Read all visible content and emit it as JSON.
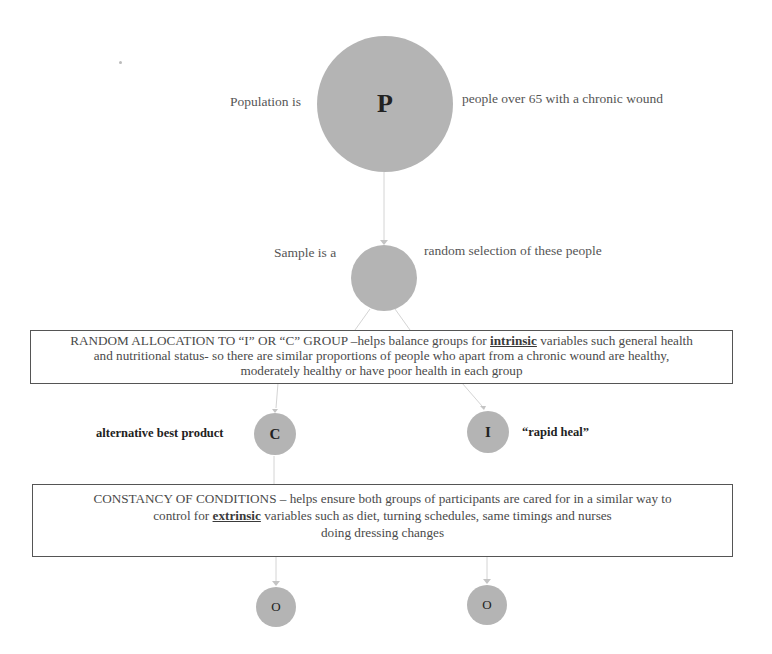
{
  "colors": {
    "node_fill": "#b4b4b4",
    "connector": "#d0d0d0",
    "box_border": "#555555",
    "text": "#555555"
  },
  "nodes": {
    "population": {
      "letter": "P",
      "label_left": "Population is",
      "label_right": "people over 65 with a chronic wound"
    },
    "sample": {
      "letter": "",
      "label_left": "Sample is a",
      "label_right": "random selection of these people"
    },
    "control": {
      "letter": "C",
      "label_left": "alternative best product"
    },
    "intervention": {
      "letter": "I",
      "label_right": "“rapid heal”"
    },
    "outcome_c": {
      "letter": "O"
    },
    "outcome_i": {
      "letter": "O"
    }
  },
  "boxes": {
    "random_allocation": {
      "line1_pre": "RANDOM ALLOCATION TO “I” OR “C” GROUP –helps balance groups for ",
      "keyword": "intrinsic",
      "line1_post": " variables such general health",
      "line2": "and nutritional status- so there are similar proportions of people who apart from a chronic wound are healthy,",
      "line3": "moderately healthy or have poor health in each group"
    },
    "constancy": {
      "line1": "CONSTANCY OF CONDITIONS – helps ensure both groups of participants are cared for in a similar way to",
      "line2_pre": "control for ",
      "keyword": "extrinsic",
      "line2_post": " variables such as diet, turning schedules, same timings and nurses",
      "line3": "doing dressing changes"
    }
  }
}
